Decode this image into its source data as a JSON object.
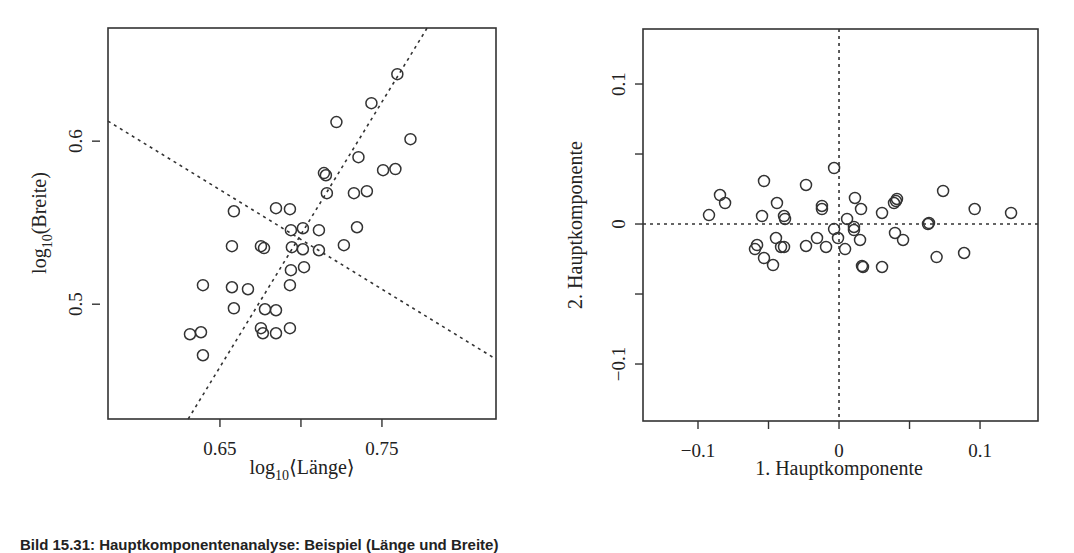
{
  "chart_data": [
    {
      "type": "scatter",
      "title": "",
      "xlabel": "log10(Länge)",
      "ylabel": "log10(Breite)",
      "xlabel_parts": {
        "pre": "log",
        "sub": "10",
        "post": "⟨Länge⟩"
      },
      "ylabel_parts": {
        "pre": "log",
        "sub": "10",
        "post": "(Breite)"
      },
      "xlim": [
        0.5809,
        0.8204
      ],
      "ylim": [
        0.4296,
        0.6694
      ],
      "xticks": [
        {
          "value": 0.65,
          "label": "0.65"
        },
        {
          "value": 0.7,
          "label": ""
        },
        {
          "value": 0.75,
          "label": "0.75"
        }
      ],
      "yticks": [
        {
          "value": 0.5,
          "label": "0.5"
        },
        {
          "value": 0.6,
          "label": "0.6"
        }
      ],
      "grid": false,
      "legend": null,
      "marker": "open-circle",
      "reference_lines": [
        {
          "name": "first-principal-axis",
          "style": "dotted",
          "from": [
            0.6304,
            0.4296
          ],
          "to": [
            0.7779,
            0.6694
          ]
        },
        {
          "name": "second-principal-axis",
          "style": "dotted",
          "from": [
            0.5809,
            0.6123
          ],
          "to": [
            0.8204,
            0.4663
          ]
        }
      ],
      "points": [
        [
          0.7595,
          0.6411
        ],
        [
          0.7435,
          0.6233
        ],
        [
          0.7219,
          0.6117
        ],
        [
          0.7676,
          0.6012
        ],
        [
          0.7355,
          0.5902
        ],
        [
          0.7583,
          0.5829
        ],
        [
          0.7507,
          0.5822
        ],
        [
          0.7142,
          0.5804
        ],
        [
          0.7154,
          0.5791
        ],
        [
          0.716,
          0.5681
        ],
        [
          0.7327,
          0.5681
        ],
        [
          0.7407,
          0.5693
        ],
        [
          0.6586,
          0.557
        ],
        [
          0.6846,
          0.5589
        ],
        [
          0.6932,
          0.5583
        ],
        [
          0.6938,
          0.5454
        ],
        [
          0.7012,
          0.5466
        ],
        [
          0.7111,
          0.5454
        ],
        [
          0.7346,
          0.5472
        ],
        [
          0.6574,
          0.5356
        ],
        [
          0.6753,
          0.5356
        ],
        [
          0.6772,
          0.5344
        ],
        [
          0.6944,
          0.535
        ],
        [
          0.7012,
          0.5337
        ],
        [
          0.7111,
          0.5331
        ],
        [
          0.7265,
          0.5362
        ],
        [
          0.6938,
          0.5209
        ],
        [
          0.7019,
          0.5227
        ],
        [
          0.6395,
          0.5117
        ],
        [
          0.6574,
          0.5104
        ],
        [
          0.6673,
          0.5092
        ],
        [
          0.6932,
          0.5117
        ],
        [
          0.6586,
          0.4975
        ],
        [
          0.6778,
          0.4969
        ],
        [
          0.6846,
          0.4963
        ],
        [
          0.6753,
          0.4853
        ],
        [
          0.6765,
          0.4822
        ],
        [
          0.6846,
          0.4822
        ],
        [
          0.6932,
          0.4853
        ],
        [
          0.6315,
          0.4816
        ],
        [
          0.6383,
          0.4828
        ],
        [
          0.6395,
          0.4687
        ]
      ]
    },
    {
      "type": "scatter",
      "title": "",
      "xlabel": "1. Hauptkomponente",
      "ylabel": "2. Hauptkomponente",
      "xlim": [
        -0.139,
        0.1411
      ],
      "ylim": [
        -0.1407,
        0.1393
      ],
      "xticks": [
        {
          "value": -0.1,
          "label": "−0.1"
        },
        {
          "value": -0.05,
          "label": ""
        },
        {
          "value": 0,
          "label": "0"
        },
        {
          "value": 0.05,
          "label": ""
        },
        {
          "value": 0.1,
          "label": "0.1"
        }
      ],
      "yticks": [
        {
          "value": -0.1,
          "label": "−0.1"
        },
        {
          "value": -0.05,
          "label": ""
        },
        {
          "value": 0,
          "label": "0"
        },
        {
          "value": 0.05,
          "label": ""
        },
        {
          "value": 0.1,
          "label": "0.1"
        }
      ],
      "grid": false,
      "legend": null,
      "marker": "open-circle",
      "reference_lines": [
        {
          "name": "x-zero-line",
          "style": "dotted",
          "orientation": "vertical",
          "value": 0
        },
        {
          "name": "y-zero-line",
          "style": "dotted",
          "orientation": "horizontal",
          "value": 0
        }
      ],
      "points": [
        [
          -0.0922,
          0.0064
        ],
        [
          -0.0844,
          0.0207
        ],
        [
          -0.0808,
          0.015
        ],
        [
          -0.0532,
          0.0307
        ],
        [
          -0.0546,
          0.0057
        ],
        [
          -0.044,
          0.015
        ],
        [
          -0.039,
          0.0057
        ],
        [
          -0.0383,
          0.0036
        ],
        [
          -0.0234,
          0.0279
        ],
        [
          -0.0121,
          0.0129
        ],
        [
          -0.0121,
          0.0107
        ],
        [
          -0.0035,
          0.04
        ],
        [
          0.0057,
          0.0036
        ],
        [
          0.0106,
          -0.0021
        ],
        [
          0.0106,
          -0.0043
        ],
        [
          0.0113,
          0.0186
        ],
        [
          0.0156,
          0.0107
        ],
        [
          0.0305,
          0.0079
        ],
        [
          0.039,
          0.015
        ],
        [
          0.0404,
          0.0164
        ],
        [
          0.0411,
          0.0179
        ],
        [
          0.0631,
          0.0
        ],
        [
          0.0638,
          0.0007
        ],
        [
          0.0738,
          0.0236
        ],
        [
          0.0962,
          0.0107
        ],
        [
          0.122,
          0.0079
        ],
        [
          -0.0035,
          -0.0036
        ],
        [
          -0.0007,
          -0.01
        ],
        [
          0.0043,
          -0.0179
        ],
        [
          0.0149,
          -0.0114
        ],
        [
          0.017,
          -0.0307
        ],
        [
          0.0163,
          -0.03
        ],
        [
          0.0305,
          -0.0307
        ],
        [
          0.0397,
          -0.0064
        ],
        [
          0.0454,
          -0.0114
        ],
        [
          0.0692,
          -0.0236
        ],
        [
          0.0887,
          -0.0207
        ],
        [
          -0.0447,
          -0.01
        ],
        [
          -0.0411,
          -0.0164
        ],
        [
          -0.039,
          -0.0164
        ],
        [
          -0.0234,
          -0.0157
        ],
        [
          -0.0156,
          -0.01
        ],
        [
          -0.0092,
          -0.0164
        ],
        [
          -0.0581,
          -0.015
        ],
        [
          -0.0596,
          -0.0179
        ],
        [
          -0.0532,
          -0.0243
        ],
        [
          -0.0468,
          -0.0293
        ]
      ]
    }
  ],
  "caption": "Bild 15.31: Hauptkomponentenanalyse: Beispiel (Länge und Breite)"
}
